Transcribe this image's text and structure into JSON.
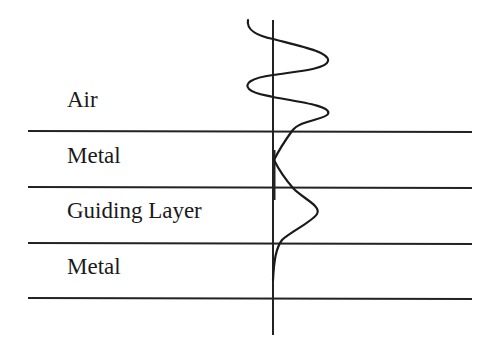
{
  "diagram": {
    "type": "layered waveguide cross-section with field profile",
    "layers": [
      {
        "label": "Air",
        "label_y": 93
      },
      {
        "label": "Metal",
        "label_y": 149
      },
      {
        "label": "Guiding Layer",
        "label_y": 204
      },
      {
        "label": "Metal",
        "label_y": 260
      }
    ],
    "boundaries_y": [
      131,
      187,
      243,
      298
    ],
    "boundary_x_range": [
      28,
      472
    ],
    "axis": {
      "x": 273,
      "y_start": 20,
      "y_end": 335
    },
    "colors": {
      "line": "#222222",
      "curve": "#1a1a1a",
      "text": "#1a1a1a",
      "background": "#ffffff"
    }
  }
}
